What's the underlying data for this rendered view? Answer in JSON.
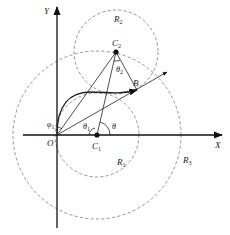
{
  "figure": {
    "axes": {
      "x_label": "X",
      "y_label": "Y",
      "origin_label": "O"
    },
    "points": {
      "c1": {
        "main": "C",
        "sub": "1"
      },
      "c2": {
        "main": "C",
        "sub": "2"
      },
      "b": {
        "main": "B",
        "sub": ""
      }
    },
    "circles": {
      "r1": {
        "main": "R",
        "sub": "1"
      },
      "r2": {
        "main": "R",
        "sub": "2"
      },
      "r3": {
        "main": "R",
        "sub": "3"
      }
    },
    "angles": {
      "phi": {
        "main": "φ",
        "sub": "1"
      },
      "theta1": {
        "main": "θ",
        "sub": "1"
      },
      "theta": {
        "main": "θ",
        "sub": ""
      },
      "theta2": {
        "main": "θ",
        "sub": "2"
      }
    }
  }
}
